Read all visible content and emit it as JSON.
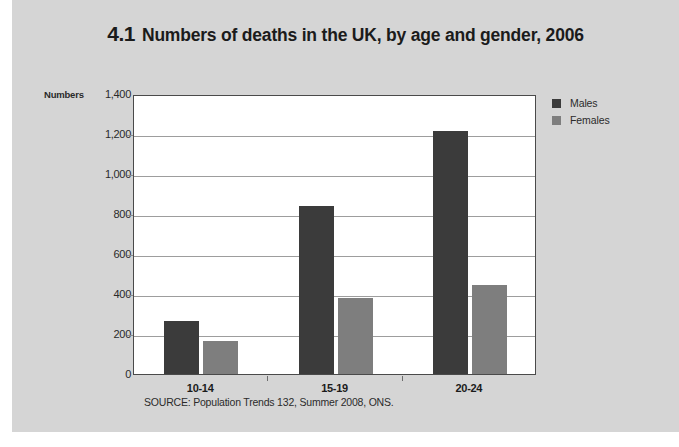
{
  "figure": {
    "number": "4.1",
    "title": "Numbers of deaths in the UK, by age and gender, 2006",
    "source": "SOURCE: Population Trends 132, Summer 2008, ONS."
  },
  "colors": {
    "page_background": "#d5d5d5",
    "plot_background": "#ffffff",
    "males": "#3b3b3b",
    "females": "#7e7e7e",
    "gridline": "#9d9d9d",
    "text": "#1b1b1b"
  },
  "legend": {
    "position": "right",
    "items": [
      {
        "label": "Males",
        "color": "#3b3b3b"
      },
      {
        "label": "Females",
        "color": "#7e7e7e"
      }
    ]
  },
  "axes": {
    "y_title": "Numbers",
    "y_ticks": [
      "1,400",
      "1,200",
      "1,000",
      "800",
      "600",
      "400",
      "200",
      "0"
    ],
    "x_ticks": [
      "10-14",
      "15-19",
      "20-24"
    ]
  },
  "chart_data": {
    "type": "bar",
    "title": "Numbers of deaths in the UK, by age and gender, 2006",
    "categories": [
      "10-14",
      "15-19",
      "20-24"
    ],
    "series": [
      {
        "name": "Males",
        "color": "#3b3b3b",
        "values": [
          265,
          840,
          1215
        ]
      },
      {
        "name": "Females",
        "color": "#7e7e7e",
        "values": [
          165,
          380,
          445
        ]
      }
    ],
    "xlabel": "",
    "ylabel": "Numbers",
    "ylim": [
      0,
      1400
    ],
    "ytick_step": 200,
    "grid": true,
    "legend_position": "right",
    "source": "SOURCE: Population Trends 132, Summer 2008, ONS."
  }
}
